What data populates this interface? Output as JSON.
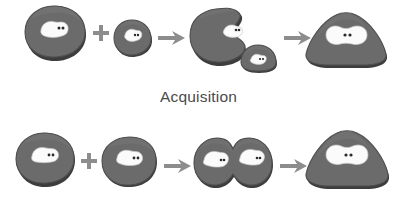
{
  "figure": {
    "title_visible": false,
    "background_color": "#ffffff",
    "blob_color": "#6b6b6b",
    "blob_shadow_color": "#3d3d3d",
    "patch_color": "#fbfbfb",
    "nucleus_dot_color": "#2a2a2a",
    "operator_color": "#8d8d8d",
    "caption_color": "#4a4a4a"
  },
  "rows": [
    {
      "id": "acquisition",
      "caption": "Acquisition",
      "steps": [
        {
          "label": "large-cell",
          "kind": "blob-large",
          "patches": 1,
          "dots": 2
        },
        {
          "label": "plus",
          "kind": "operator-plus"
        },
        {
          "label": "small-cell",
          "kind": "blob-small",
          "patches": 1,
          "dots": 2
        },
        {
          "label": "arrow-1",
          "kind": "operator-arrow"
        },
        {
          "label": "engulfing-cell",
          "kind": "blob-notched",
          "patches": 1,
          "dots": 2
        },
        {
          "label": "engulfed-cell",
          "kind": "blob-small-dome",
          "patches": 1,
          "dots": 2
        },
        {
          "label": "arrow-2",
          "kind": "operator-arrow"
        },
        {
          "label": "merged-cell",
          "kind": "blob-triangular",
          "patches": 1,
          "dots": 2
        }
      ]
    },
    {
      "id": "fusion",
      "caption": "",
      "steps": [
        {
          "label": "cell-a",
          "kind": "blob-round",
          "patches": 1,
          "dots": 2
        },
        {
          "label": "plus",
          "kind": "operator-plus"
        },
        {
          "label": "cell-b",
          "kind": "blob-round",
          "patches": 1,
          "dots": 2
        },
        {
          "label": "arrow-1",
          "kind": "operator-arrow"
        },
        {
          "label": "fusing-pair",
          "kind": "blob-pair",
          "patches": 2,
          "dots": 4
        },
        {
          "label": "arrow-2",
          "kind": "operator-arrow"
        },
        {
          "label": "merged-cell",
          "kind": "blob-triangular",
          "patches": 1,
          "dots": 2
        }
      ]
    }
  ]
}
